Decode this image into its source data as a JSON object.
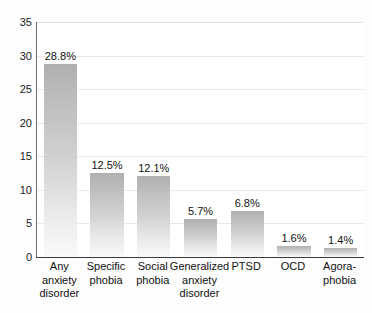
{
  "chart_data": {
    "type": "bar",
    "title": "",
    "subtitle": "",
    "xlabel": "",
    "ylabel": "",
    "ylim": [
      0,
      35
    ],
    "ytick_values": [
      0,
      5,
      10,
      15,
      20,
      25,
      30,
      35
    ],
    "ytick_labels": [
      "0",
      "5",
      "10",
      "15",
      "20",
      "25",
      "30",
      "35"
    ],
    "grid": true,
    "grid_axis": "y",
    "legend": false,
    "legend_position": "none",
    "categories": [
      "Any anxiety disorder",
      "Specific phobia",
      "Social phobia",
      "Generalized anxiety disorder",
      "PTSD",
      "OCD",
      "Agora-phobia"
    ],
    "category_lines": [
      [
        "Any",
        "anxiety",
        "disorder"
      ],
      [
        "Specific",
        "phobia"
      ],
      [
        "Social",
        "phobia"
      ],
      [
        "Generalized",
        "anxiety",
        "disorder"
      ],
      [
        "PTSD"
      ],
      [
        "OCD"
      ],
      [
        "Agora-",
        "phobia"
      ]
    ],
    "values": [
      28.8,
      12.5,
      12.1,
      5.7,
      6.8,
      1.6,
      1.4
    ],
    "data_labels": [
      "28.8%",
      "12.5%",
      "12.1%",
      "5.7%",
      "6.8%",
      "1.6%",
      "1.4%"
    ],
    "colors": {
      "bar_top": "#b0b0b0",
      "bar_bottom": "#fafafa",
      "gridline": "#e9e9e9",
      "axis": "#3b3b3b",
      "text": "#111111",
      "background": "#fdfdfd"
    }
  }
}
